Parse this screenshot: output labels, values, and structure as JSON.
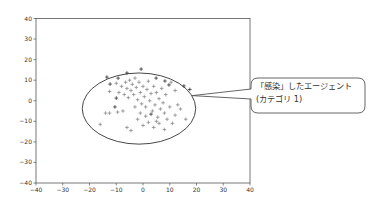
{
  "chart_data": {
    "type": "scatter",
    "title": "",
    "xlabel": "",
    "ylabel": "",
    "xlim": [
      -40,
      40
    ],
    "ylim": [
      -40,
      40
    ],
    "grid": false,
    "legend": null,
    "x_ticks": [
      -40,
      -30,
      -20,
      -10,
      0,
      10,
      20,
      30,
      40
    ],
    "y_ticks": [
      40,
      30,
      20,
      10,
      0,
      -10,
      -20,
      -30,
      -40
    ],
    "marker": "+",
    "series": [
      {
        "name": "infected (category 1)",
        "color": "#333333",
        "points": [
          [
            -13.5,
            11.5
          ],
          [
            -9.3,
            11
          ],
          [
            -6,
            13.5
          ],
          [
            -0.7,
            15.4
          ],
          [
            4.9,
            11
          ],
          [
            8.2,
            9.6
          ],
          [
            9.7,
            7.7
          ],
          [
            15.3,
            7.2
          ],
          [
            -12.3,
            8.1
          ],
          [
            -10,
            1.3
          ],
          [
            -10.5,
            -3
          ],
          [
            3,
            -6.5
          ],
          [
            17.5,
            5.5
          ]
        ]
      },
      {
        "name": "other agents",
        "color": "#8c8c8c",
        "points": [
          [
            -12.5,
            4.5
          ],
          [
            -10,
            8.5
          ],
          [
            -9,
            4
          ],
          [
            -8,
            7
          ],
          [
            -7,
            3
          ],
          [
            -6.5,
            9
          ],
          [
            -6,
            6
          ],
          [
            -5.5,
            1.5
          ],
          [
            -5,
            10
          ],
          [
            -4.5,
            5
          ],
          [
            -4,
            8
          ],
          [
            -3.5,
            3
          ],
          [
            -3,
            11
          ],
          [
            -2.5,
            6.5
          ],
          [
            -2,
            0.5
          ],
          [
            -1.5,
            9
          ],
          [
            -1,
            4
          ],
          [
            -0.5,
            -1.5
          ],
          [
            0,
            7
          ],
          [
            0.5,
            2
          ],
          [
            1,
            -3
          ],
          [
            1.5,
            5.5
          ],
          [
            2,
            9.5
          ],
          [
            2.5,
            0
          ],
          [
            3,
            3.5
          ],
          [
            3.5,
            -5
          ],
          [
            4,
            7
          ],
          [
            4.5,
            -2
          ],
          [
            5,
            4
          ],
          [
            5.5,
            -8
          ],
          [
            6,
            1
          ],
          [
            6.5,
            -4
          ],
          [
            7,
            6
          ],
          [
            7.5,
            -1
          ],
          [
            8,
            -6
          ],
          [
            8.5,
            3
          ],
          [
            9,
            -9
          ],
          [
            10,
            -3
          ],
          [
            11,
            -11
          ],
          [
            12,
            -7
          ],
          [
            13,
            -2
          ],
          [
            -14,
            -6
          ],
          [
            -12.5,
            -6
          ],
          [
            -9.5,
            -5.5
          ],
          [
            -7.5,
            -5
          ],
          [
            -16,
            -11.5
          ],
          [
            -6,
            -13
          ],
          [
            -4.5,
            -14.5
          ],
          [
            -2,
            -9
          ],
          [
            0,
            -12
          ],
          [
            2,
            -10.5
          ],
          [
            4,
            -13
          ],
          [
            6,
            -11
          ],
          [
            8,
            -14
          ],
          [
            14,
            -4
          ],
          [
            16,
            -9
          ],
          [
            10.5,
            9
          ],
          [
            12,
            5
          ],
          [
            -1,
            -6
          ],
          [
            1,
            -7.5
          ],
          [
            -3,
            -3
          ],
          [
            5,
            -10
          ]
        ]
      }
    ],
    "annotations": [
      {
        "type": "ellipse",
        "center": [
          -1.5,
          -3.8
        ],
        "radius_x": 21.2,
        "radius_y": 17.3,
        "stroke": "#333333"
      },
      {
        "type": "callout",
        "text_lines": [
          "「感染」したエージェント",
          "(カテゴリ 1)"
        ],
        "target": [
          18.4,
          2.5
        ],
        "box_px": {
          "x": 251,
          "y": 78,
          "w": 114,
          "h": 35,
          "r": 7
        }
      }
    ]
  },
  "callout": {
    "line1": "「感染」したエージェント",
    "line2": "(カテゴリ 1)"
  },
  "plot_px": {
    "left": 36,
    "right": 250,
    "top": 18.5,
    "bottom": 183
  }
}
